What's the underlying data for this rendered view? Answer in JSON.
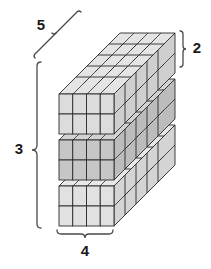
{
  "figure": {
    "kind": "isometric-cube-stack-diagram",
    "background_color": "#ffffff",
    "line_color": "#2b2b2b",
    "brace_color": "#4a4a4a"
  },
  "structure": {
    "width_cubes": 4,
    "depth_cubes": 5,
    "layer_height_cubes": 2,
    "layer_count": 3,
    "total_cubes": 120,
    "layers": [
      {
        "name": "top-layer",
        "front_fill": "#dcdcdc",
        "top_fill": "#e4e4e4",
        "side_fill": "#cfcfcf"
      },
      {
        "name": "middle-layer",
        "front_fill": "#c6c6c6",
        "top_fill": "#d2d2d2",
        "side_fill": "#bcbcbc"
      },
      {
        "name": "bottom-layer",
        "front_fill": "#e1e1e1",
        "top_fill": "#e8e8e8",
        "side_fill": "#d4d4d4"
      }
    ]
  },
  "labels": {
    "depth": "5",
    "layer_height": "2",
    "stack_height": "3",
    "width": "4"
  },
  "braces": [
    {
      "name": "depth-brace",
      "label": "5",
      "orientation": "diagonal-top-left"
    },
    {
      "name": "layer-height-brace",
      "label": "2",
      "orientation": "vertical-right"
    },
    {
      "name": "stack-height-brace",
      "label": "3",
      "orientation": "vertical-left"
    },
    {
      "name": "width-brace",
      "label": "4",
      "orientation": "horizontal-bottom"
    }
  ]
}
